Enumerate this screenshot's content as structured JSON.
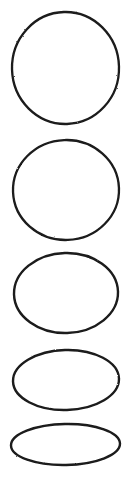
{
  "document": {
    "kind": "scanned-figure",
    "background_color": "#ffffff",
    "ink_color": "#1a1a1a",
    "width": 132,
    "height": 489,
    "clipped_top_text": "ellipse series"
  },
  "chart_data": {
    "type": "scatter",
    "title": "",
    "subtitle": "",
    "xlabel": "",
    "ylabel": "",
    "grid": false,
    "legend_position": "none",
    "xlim": [
      0,
      132
    ],
    "ylim": [
      0,
      489
    ],
    "shapes": [
      {
        "name": "ellipse-1",
        "label": "circle",
        "cx": 65.5,
        "cy": 68,
        "rx": 53.5,
        "ry": 56,
        "width": 107,
        "height": 112,
        "stroke": "#1a1a1a",
        "stroke_width": 2.3,
        "fill": "none",
        "rotation": -1.5
      },
      {
        "name": "ellipse-2",
        "label": "ellipse-100",
        "cx": 66,
        "cy": 190,
        "rx": 53,
        "ry": 50,
        "width": 106,
        "height": 100,
        "stroke": "#1a1a1a",
        "stroke_width": 2.3,
        "fill": "none",
        "rotation": -2
      },
      {
        "name": "ellipse-3",
        "label": "ellipse-80",
        "cx": 66,
        "cy": 293,
        "rx": 52,
        "ry": 40,
        "width": 104,
        "height": 80,
        "stroke": "#1a1a1a",
        "stroke_width": 2.4,
        "fill": "none",
        "rotation": -1.5
      },
      {
        "name": "ellipse-4",
        "label": "ellipse-60",
        "cx": 66,
        "cy": 380,
        "rx": 53,
        "ry": 30,
        "width": 106,
        "height": 60,
        "stroke": "#1a1a1a",
        "stroke_width": 2.4,
        "fill": "none",
        "rotation": -1.5
      },
      {
        "name": "ellipse-5",
        "label": "ellipse-41",
        "cx": 65.5,
        "cy": 444.5,
        "rx": 54.5,
        "ry": 20.5,
        "width": 109,
        "height": 41,
        "stroke": "#1a1a1a",
        "stroke_width": 2.4,
        "fill": "none",
        "rotation": -1
      }
    ]
  }
}
